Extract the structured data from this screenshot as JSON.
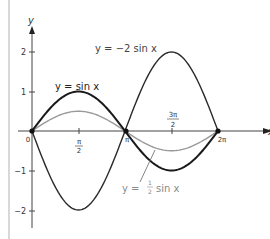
{
  "chart_data": {
    "type": "line",
    "title": "",
    "xlabel": "x",
    "ylabel": "y",
    "xlim": [
      0,
      6.2832
    ],
    "ylim": [
      -2.3,
      2.5
    ],
    "grid": false,
    "x_ticks": [
      {
        "value": 0,
        "label": "0"
      },
      {
        "value": 1.5708,
        "label": "π/2"
      },
      {
        "value": 3.1416,
        "label": "π"
      },
      {
        "value": 4.7124,
        "label": "3π/2"
      },
      {
        "value": 6.2832,
        "label": "2π"
      }
    ],
    "y_ticks": [
      {
        "value": 2,
        "label": "2"
      },
      {
        "value": 1,
        "label": "1"
      },
      {
        "value": -1,
        "label": "−1"
      },
      {
        "value": -2,
        "label": "−2"
      }
    ],
    "series": [
      {
        "name": "y = sin x",
        "function": "sin(x)",
        "amplitude": 1,
        "color": "#222222",
        "x": [
          0,
          1.5708,
          3.1416,
          4.7124,
          6.2832
        ],
        "values": [
          0,
          1,
          0,
          -1,
          0
        ]
      },
      {
        "name": "y = −2 sin x",
        "function": "-2*sin(x)",
        "amplitude": -2,
        "color": "#333333",
        "x": [
          0,
          1.5708,
          3.1416,
          4.7124,
          6.2832
        ],
        "values": [
          0,
          -2,
          0,
          2,
          0
        ]
      },
      {
        "name": "y = ½ sin x",
        "function": "0.5*sin(x)",
        "amplitude": 0.5,
        "color": "#999999",
        "x": [
          0,
          1.5708,
          3.1416,
          4.7124,
          6.2832
        ],
        "values": [
          0,
          0.5,
          0,
          -0.5,
          0
        ]
      }
    ],
    "annotations": [
      {
        "text": "y = sin x",
        "near": "peak of sin x at π/2"
      },
      {
        "text": "y = −2 sin x",
        "near": "peak of −2 sin x at 3π/2"
      },
      {
        "text": "y = ½ sin x",
        "near": "trough of ½ sin x, with leader line"
      }
    ],
    "intersection_points": [
      "(0,0)",
      "(π,0)",
      "(2π,0)"
    ]
  },
  "labels": {
    "axis_x": "x",
    "axis_y": "y",
    "origin": "0",
    "pi": "π",
    "two_pi": "2π",
    "half_pi_num": "π",
    "half_pi_den": "2",
    "three_half_pi_num": "3π",
    "three_half_pi_den": "2",
    "y2": "2",
    "y1": "1",
    "ym1": "−1",
    "ym2": "−2",
    "sin_label": "y = sin x",
    "neg2_label": "y = −2 sin x",
    "half_label_y": "y = ",
    "half_label_num": "1",
    "half_label_den": "2",
    "half_label_tail": "sin x"
  },
  "colors": {
    "axis": "#444444",
    "curve_dark": "#1e1e1e",
    "curve_light": "#9a9a9a",
    "label_gray": "#8a8a8a",
    "border": "#bdbdbd"
  }
}
